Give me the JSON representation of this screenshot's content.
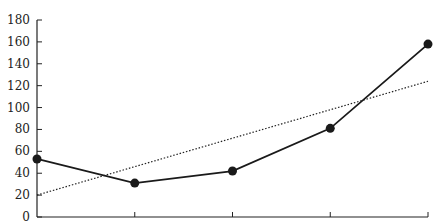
{
  "chart_data": {
    "type": "line",
    "title": "",
    "xlabel": "",
    "ylabel": "",
    "categories": [
      "1",
      "2",
      "3",
      "4",
      "5"
    ],
    "series": [
      {
        "name": "values",
        "style": "solid-with-markers",
        "color": "#1a1a1a",
        "values": [
          53,
          31,
          42,
          81,
          158
        ]
      },
      {
        "name": "linear trend",
        "style": "dotted",
        "color": "#1a1a1a",
        "values": [
          20,
          46,
          72,
          98,
          124
        ]
      }
    ],
    "ylim": [
      0,
      180
    ],
    "yticks": [
      0,
      20,
      40,
      60,
      80,
      100,
      120,
      140,
      160,
      180
    ],
    "xtick_labels_visible": false,
    "grid": false,
    "legend": "none"
  },
  "layout": {
    "plot_left": 37,
    "plot_right": 428,
    "baseline_y": 217,
    "top_y": 20
  }
}
